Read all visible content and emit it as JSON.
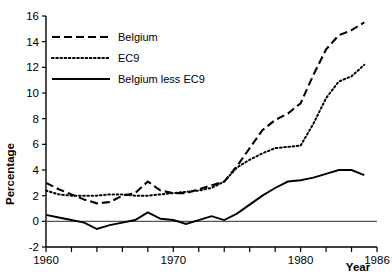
{
  "chart_data": {
    "type": "line",
    "title": "",
    "xlabel": "Year",
    "ylabel": "Percentage",
    "xlim": [
      1960,
      1986
    ],
    "ylim": [
      -2,
      16
    ],
    "grid": false,
    "legend_position": "upper-left",
    "y_ticks": [
      -2,
      0,
      2,
      4,
      6,
      8,
      10,
      12,
      14,
      16
    ],
    "y_tick_labels": [
      "-2",
      "0",
      "2",
      "4",
      "6",
      "8",
      "10",
      "12",
      "14",
      "16"
    ],
    "x_ticks": [
      1960,
      1962,
      1964,
      1966,
      1968,
      1970,
      1972,
      1974,
      1976,
      1978,
      1980,
      1982,
      1984,
      1986
    ],
    "x_tick_labels_shown": [
      "1960",
      "1970",
      "1980",
      "1986"
    ],
    "x_labeled_ticks": [
      1960,
      1970,
      1980,
      1986
    ],
    "annotations": [
      "zero reference line drawn across plot at y=0"
    ],
    "x": [
      1960,
      1961,
      1962,
      1963,
      1964,
      1965,
      1966,
      1967,
      1968,
      1969,
      1970,
      1971,
      1972,
      1973,
      1974,
      1975,
      1976,
      1977,
      1978,
      1979,
      1980,
      1981,
      1982,
      1983,
      1984,
      1985
    ],
    "series": [
      {
        "name": "Belgium",
        "style": "dashed",
        "color": "#000000",
        "values": [
          3.0,
          2.5,
          2.1,
          1.7,
          1.4,
          1.5,
          2.0,
          2.2,
          3.1,
          2.4,
          2.2,
          2.2,
          2.5,
          2.8,
          3.1,
          4.3,
          5.7,
          7.1,
          7.9,
          8.4,
          9.2,
          11.4,
          13.4,
          14.5,
          14.9,
          15.5
        ]
      },
      {
        "name": "EC9",
        "style": "dotted",
        "color": "#000000",
        "values": [
          2.4,
          2.1,
          2.0,
          2.0,
          2.0,
          2.1,
          2.1,
          2.0,
          2.0,
          2.1,
          2.2,
          2.3,
          2.4,
          2.6,
          3.1,
          4.2,
          4.8,
          5.3,
          5.7,
          5.8,
          5.9,
          7.6,
          9.6,
          10.9,
          11.3,
          12.2
        ]
      },
      {
        "name": "Belgium less EC9",
        "style": "solid",
        "color": "#000000",
        "values": [
          0.5,
          0.3,
          0.1,
          -0.1,
          -0.6,
          -0.3,
          -0.1,
          0.1,
          0.7,
          0.2,
          0.1,
          -0.2,
          0.1,
          0.4,
          0.1,
          0.6,
          1.3,
          2.0,
          2.6,
          3.1,
          3.2,
          3.4,
          3.7,
          4.0,
          4.0,
          3.6
        ]
      }
    ]
  },
  "legend": {
    "items": [
      {
        "label": "Belgium",
        "style": "dashed"
      },
      {
        "label": "EC9",
        "style": "dotted"
      },
      {
        "label": "Belgium less EC9",
        "style": "solid"
      }
    ]
  },
  "axes": {
    "y_title": "Percentage",
    "x_title": "Year"
  }
}
